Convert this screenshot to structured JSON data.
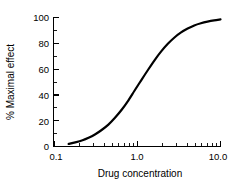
{
  "chart_data": {
    "type": "line",
    "title": "",
    "subtitle": "",
    "xlabel": "Drug concentration",
    "ylabel": "% Maximal effect",
    "xscale": "log",
    "yscale": "linear",
    "xlim": [
      0.1,
      10.0
    ],
    "ylim": [
      0,
      100
    ],
    "grid": false,
    "legend": null,
    "legend_position": "none",
    "annotations": [],
    "x_ticks_major": [
      0.1,
      1.0,
      10.0
    ],
    "x_tick_labels": [
      "0.1",
      "1.0",
      "10.0"
    ],
    "x_ticks_minor": [
      0.2,
      0.3,
      0.4,
      0.5,
      0.6,
      0.7,
      0.8,
      0.9,
      2.0,
      3.0,
      4.0,
      5.0,
      6.0,
      7.0,
      8.0,
      9.0
    ],
    "y_ticks_major": [
      0,
      20,
      40,
      60,
      80,
      100
    ],
    "y_tick_labels": [
      "0",
      "20",
      "40",
      "60",
      "80",
      "100"
    ],
    "y_ticks_minor": [
      10,
      30,
      50,
      70,
      90
    ],
    "series": [
      {
        "name": "dose-response",
        "color": "#000000",
        "linewidth": 2.2,
        "model": "hill",
        "ec50": 1.15,
        "hill_slope": 1.35,
        "emax": 100,
        "emin": 0,
        "x": [
          0.15,
          0.18,
          0.22,
          0.26,
          0.31,
          0.37,
          0.45,
          0.54,
          0.65,
          0.78,
          0.93,
          1.12,
          1.35,
          1.62,
          1.94,
          2.33,
          2.8,
          3.36,
          4.03,
          4.84,
          5.81,
          6.98,
          8.38,
          10.0
        ],
        "y": [
          2.0,
          3.2,
          4.8,
          6.7,
          9.3,
          12.6,
          17.0,
          22.3,
          28.5,
          35.6,
          43.4,
          51.5,
          59.5,
          67.0,
          73.7,
          79.6,
          84.5,
          88.4,
          91.4,
          93.8,
          95.5,
          96.8,
          97.8,
          98.5
        ]
      }
    ]
  },
  "axes": {
    "y_title": "% Maximal effect",
    "x_title": "Drug concentration",
    "y_labels": [
      "100",
      "80",
      "60",
      "40",
      "20",
      "0"
    ],
    "x_labels": [
      "0.1",
      "1.0",
      "10.0"
    ]
  },
  "colors": {
    "background": "#ffffff",
    "foreground": "#000000",
    "curve": "#000000"
  }
}
